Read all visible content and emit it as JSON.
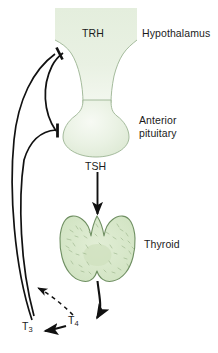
{
  "figure": {
    "background_color": "#ffffff",
    "width": 218,
    "height": 353
  },
  "labels": {
    "hypothalamus": "Hypothalamus",
    "trh": "TRH",
    "anterior_pituitary": "Anterior\npituitary",
    "tsh": "TSH",
    "thyroid": "Thyroid",
    "t3": "T",
    "t3_sub": "3",
    "t4": "T",
    "t4_sub": "4"
  },
  "colors": {
    "tissue_fill_light": "#eef4e9",
    "tissue_fill_mid": "#dfeada",
    "tissue_stroke": "#8aa57f",
    "thyroid_fill": "#d8e8cc",
    "thyroid_stroke": "#6f8f62",
    "arrow_stroke": "#111111",
    "text": "#1b1b1b"
  },
  "connectors": [
    {
      "name": "tsh-stimulation-arrow",
      "from": "anterior pituitary",
      "to": "thyroid",
      "style": "solid",
      "ending": "arrowhead"
    },
    {
      "name": "thyroid-output-arrow",
      "from": "thyroid",
      "to": "T4",
      "style": "solid",
      "ending": "arrowhead"
    },
    {
      "name": "t4-to-t3-conversion-arrow",
      "from": "T4",
      "to": "T3",
      "style": "solid",
      "ending": "arrowhead"
    },
    {
      "name": "t4-feedback-dashed",
      "from": "T4",
      "to": "feedback loop",
      "style": "dashed",
      "ending": "arrowhead"
    },
    {
      "name": "negative-feedback-to-hypothalamus",
      "from": "T3",
      "to": "hypothalamus",
      "style": "solid",
      "ending": "inhibition-bar"
    },
    {
      "name": "negative-feedback-to-pituitary",
      "from": "T3",
      "to": "anterior pituitary",
      "style": "solid",
      "ending": "inhibition-bar"
    }
  ]
}
